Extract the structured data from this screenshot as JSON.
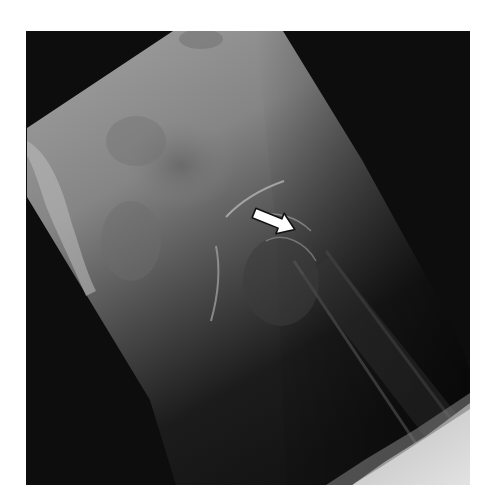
{
  "figure": {
    "type": "radiograph",
    "annotation": {
      "kind": "arrow",
      "color": "#ffffff",
      "outline": "#111111",
      "direction": "pointing right-down toward femoral head-neck junction"
    },
    "colors": {
      "page_background": "#ffffff",
      "frame_background": "#0d0d0d",
      "film_light": "#9a9a9a",
      "film_mid": "#6e6e6e",
      "film_dark": "#1e1e1e",
      "bright_wedge": "#d8d8d8"
    }
  }
}
